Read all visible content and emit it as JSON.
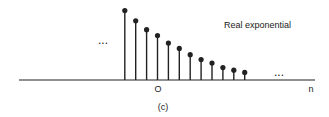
{
  "chart_data": {
    "type": "stem",
    "title": "Real exponential",
    "caption": "(c)",
    "xlabel": "n",
    "ylabel": "",
    "x_tick_labels": [
      {
        "n": 0,
        "label": "O"
      }
    ],
    "n": [
      -3,
      -2,
      -1,
      0,
      1,
      2,
      3,
      4,
      5,
      6,
      7,
      8
    ],
    "values": [
      1.56,
      1.33,
      1.13,
      1.0,
      0.83,
      0.71,
      0.57,
      0.46,
      0.38,
      0.28,
      0.22,
      0.17
    ],
    "ylim": [
      0,
      1.6
    ],
    "continuation_left": "...",
    "continuation_right": "...",
    "grid": false,
    "legend": "none"
  },
  "colors": {
    "ink": "#222222",
    "background": "#ffffff"
  }
}
